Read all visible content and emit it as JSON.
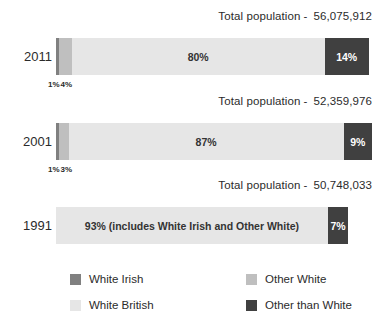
{
  "chart_data": {
    "type": "bar",
    "title": "",
    "subtitle": "",
    "xlabel": "",
    "ylabel": "",
    "orientation": "horizontal",
    "stacked": true,
    "normalized_percent": true,
    "grid": false,
    "xlim": [
      0,
      100
    ],
    "legend_position": "bottom",
    "categories": [
      "2011",
      "2001",
      "1991"
    ],
    "series": [
      {
        "name": "White Irish",
        "color": "#808080",
        "values": [
          1,
          1,
          null
        ]
      },
      {
        "name": "Other White",
        "color": "#bfbfbf",
        "values": [
          4,
          3,
          null
        ]
      },
      {
        "name": "White British",
        "color": "#e6e6e6",
        "values": [
          80,
          87,
          93
        ]
      },
      {
        "name": "Other than White",
        "color": "#404040",
        "values": [
          14,
          9,
          7
        ]
      }
    ],
    "annotations": [
      "Total population -  56,075,912",
      "Total population -  52,359,976",
      "Total population -  50,748,033",
      "93% (includes White Irish and Other White)"
    ]
  },
  "totals_label": "Total population",
  "totals_separator": "-",
  "rows": [
    {
      "year": "2011",
      "total": "56,075,912",
      "bar_width_pct": 100,
      "segments": [
        {
          "key": "white_irish",
          "label": "1%",
          "pct": 1,
          "color": "#808080",
          "label_color": "dark",
          "tiny": true
        },
        {
          "key": "other_white",
          "label": "4%",
          "pct": 4,
          "color": "#bfbfbf",
          "label_color": "dark",
          "tiny": true
        },
        {
          "key": "white_british",
          "label": "80%",
          "pct": 80,
          "color": "#e6e6e6",
          "label_color": "dark",
          "tiny": false
        },
        {
          "key": "other_than_white",
          "label": "14%",
          "pct": 14,
          "color": "#404040",
          "label_color": "light",
          "tiny": false
        }
      ]
    },
    {
      "year": "2001",
      "total": "52,359,976",
      "bar_width_pct": 100,
      "segments": [
        {
          "key": "white_irish",
          "label": "1%",
          "pct": 1,
          "color": "#808080",
          "label_color": "dark",
          "tiny": true
        },
        {
          "key": "other_white",
          "label": "3%",
          "pct": 3,
          "color": "#bfbfbf",
          "label_color": "dark",
          "tiny": true
        },
        {
          "key": "white_british",
          "label": "87%",
          "pct": 87,
          "color": "#e6e6e6",
          "label_color": "dark",
          "tiny": false
        },
        {
          "key": "other_than_white",
          "label": "9%",
          "pct": 9,
          "color": "#404040",
          "label_color": "light",
          "tiny": false
        }
      ]
    },
    {
      "year": "1991",
      "total": "50,748,033",
      "bar_width_pct": 92.5,
      "segments": [
        {
          "key": "white_british",
          "label": "93% (includes White Irish and Other White)",
          "pct": 93,
          "color": "#e6e6e6",
          "label_color": "dark",
          "tiny": false
        },
        {
          "key": "other_than_white",
          "label": "7%",
          "pct": 7,
          "color": "#404040",
          "label_color": "light",
          "tiny": false
        }
      ]
    }
  ],
  "legend": [
    {
      "label": "White Irish",
      "color": "#808080"
    },
    {
      "label": "Other White",
      "color": "#bfbfbf"
    },
    {
      "label": "White British",
      "color": "#e6e6e6"
    },
    {
      "label": "Other than White",
      "color": "#404040"
    }
  ]
}
